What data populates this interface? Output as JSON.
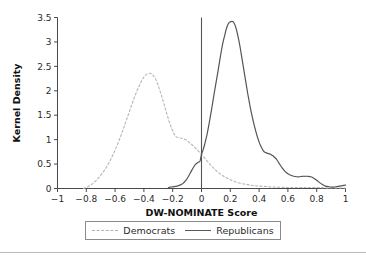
{
  "chart_data": {
    "type": "line",
    "title": "",
    "xlabel": "DW-NOMINATE Score",
    "ylabel": "Kernel Density",
    "xlim": [
      -1,
      1
    ],
    "ylim": [
      0,
      3.5
    ],
    "grid": false,
    "legend_position": "bottom",
    "x_ticks": [
      "-1",
      "-0.8",
      "-0.6",
      "-0.4",
      "-0.2",
      "0",
      "0.2",
      "0.4",
      "0.6",
      "0.8",
      "1"
    ],
    "x_tick_values": [
      -1,
      -0.8,
      -0.6,
      -0.4,
      -0.2,
      0,
      0.2,
      0.4,
      0.6,
      0.8,
      1
    ],
    "y_ticks": [
      "0",
      "0.5",
      "1",
      "1.5",
      "2",
      "2.5",
      "3",
      "3.5"
    ],
    "y_tick_values": [
      0,
      0.5,
      1,
      1.5,
      2,
      2.5,
      3,
      3.5
    ],
    "annotations": [
      {
        "name": "zero-reference-line",
        "type": "vline",
        "x": 0,
        "color": "#555555"
      }
    ],
    "series": [
      {
        "name": "Democrats",
        "style": "dashed",
        "color": "#b5b5b5",
        "x": [
          -0.82,
          -0.8,
          -0.78,
          -0.76,
          -0.74,
          -0.72,
          -0.7,
          -0.68,
          -0.66,
          -0.64,
          -0.62,
          -0.6,
          -0.58,
          -0.56,
          -0.54,
          -0.52,
          -0.5,
          -0.48,
          -0.46,
          -0.44,
          -0.42,
          -0.4,
          -0.38,
          -0.36,
          -0.35,
          -0.34,
          -0.32,
          -0.3,
          -0.28,
          -0.26,
          -0.24,
          -0.22,
          -0.2,
          -0.18,
          -0.16,
          -0.14,
          -0.12,
          -0.1,
          -0.08,
          -0.06,
          -0.04,
          -0.02,
          0.0,
          0.02,
          0.04,
          0.06,
          0.08,
          0.1,
          0.12,
          0.14,
          0.16,
          0.18,
          0.2,
          0.24,
          0.28,
          0.32,
          0.36,
          0.4,
          0.45,
          0.5,
          0.6,
          0.7,
          0.8,
          0.9,
          1.0
        ],
        "y": [
          0.0,
          0.02,
          0.05,
          0.09,
          0.14,
          0.2,
          0.27,
          0.35,
          0.44,
          0.54,
          0.66,
          0.79,
          0.93,
          1.08,
          1.24,
          1.41,
          1.58,
          1.75,
          1.91,
          2.05,
          2.18,
          2.28,
          2.34,
          2.36,
          2.35,
          2.33,
          2.25,
          2.1,
          1.92,
          1.72,
          1.52,
          1.33,
          1.18,
          1.07,
          1.04,
          1.03,
          1.01,
          0.98,
          0.93,
          0.88,
          0.82,
          0.76,
          0.7,
          0.63,
          0.56,
          0.49,
          0.43,
          0.37,
          0.32,
          0.28,
          0.24,
          0.21,
          0.18,
          0.13,
          0.1,
          0.08,
          0.06,
          0.05,
          0.04,
          0.03,
          0.02,
          0.02,
          0.02,
          0.01,
          0.01
        ],
        "peak_x": -0.36,
        "peak_y": 2.36
      },
      {
        "name": "Republicans",
        "style": "solid",
        "color": "#555555",
        "x": [
          -0.23,
          -0.21,
          -0.19,
          -0.17,
          -0.15,
          -0.13,
          -0.11,
          -0.09,
          -0.07,
          -0.05,
          -0.04,
          -0.03,
          -0.02,
          -0.01,
          0.0,
          0.01,
          0.02,
          0.03,
          0.04,
          0.05,
          0.06,
          0.07,
          0.08,
          0.09,
          0.1,
          0.11,
          0.12,
          0.13,
          0.14,
          0.15,
          0.16,
          0.17,
          0.18,
          0.19,
          0.2,
          0.21,
          0.22,
          0.23,
          0.24,
          0.25,
          0.26,
          0.27,
          0.28,
          0.29,
          0.3,
          0.31,
          0.32,
          0.33,
          0.34,
          0.35,
          0.36,
          0.37,
          0.38,
          0.39,
          0.4,
          0.41,
          0.42,
          0.43,
          0.44,
          0.45,
          0.46,
          0.47,
          0.48,
          0.49,
          0.5,
          0.52,
          0.54,
          0.56,
          0.58,
          0.6,
          0.62,
          0.64,
          0.66,
          0.68,
          0.7,
          0.72,
          0.74,
          0.76,
          0.78,
          0.8,
          0.82,
          0.84,
          0.86,
          0.88,
          0.9,
          0.92,
          0.94,
          0.96,
          0.98,
          1.0
        ],
        "y": [
          0.02,
          0.03,
          0.04,
          0.05,
          0.07,
          0.1,
          0.16,
          0.25,
          0.36,
          0.46,
          0.5,
          0.52,
          0.54,
          0.56,
          0.7,
          0.78,
          0.88,
          1.0,
          1.13,
          1.28,
          1.45,
          1.62,
          1.8,
          1.98,
          2.15,
          2.32,
          2.5,
          2.68,
          2.85,
          3.0,
          3.12,
          3.24,
          3.33,
          3.39,
          3.41,
          3.42,
          3.41,
          3.36,
          3.28,
          3.16,
          3.02,
          2.86,
          2.68,
          2.5,
          2.32,
          2.14,
          1.96,
          1.8,
          1.64,
          1.5,
          1.37,
          1.25,
          1.14,
          1.04,
          0.95,
          0.88,
          0.82,
          0.77,
          0.74,
          0.73,
          0.72,
          0.71,
          0.7,
          0.68,
          0.66,
          0.6,
          0.51,
          0.42,
          0.35,
          0.3,
          0.27,
          0.25,
          0.24,
          0.24,
          0.25,
          0.25,
          0.25,
          0.24,
          0.21,
          0.17,
          0.12,
          0.08,
          0.05,
          0.04,
          0.03,
          0.03,
          0.04,
          0.05,
          0.06,
          0.07
        ],
        "peak_x": 0.21,
        "peak_y": 3.42
      }
    ]
  },
  "legend": {
    "entries": [
      {
        "label": "Democrats",
        "style": "dashed"
      },
      {
        "label": "Republicans",
        "style": "solid"
      }
    ]
  }
}
